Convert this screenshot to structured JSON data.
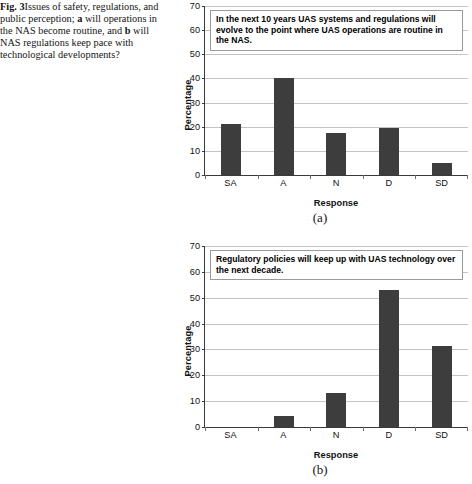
{
  "caption": {
    "figure_label": "Fig. 3",
    "text_part1": "Issues of safety, regulations, and public perception; ",
    "sub_a": "a",
    "text_part2": " will operations in the NAS become routine, and ",
    "sub_b": "b",
    "text_part3": " will NAS regulations keep pace with technological developments?"
  },
  "colors": {
    "bar": "#3d3d3d",
    "grid": "#c3c3c3",
    "axis": "#3a3a3a",
    "title_box_border": "#9a9a9a"
  },
  "panels": [
    {
      "letter": "(a)"
    },
    {
      "letter": "(b)"
    }
  ],
  "chart_data": [
    {
      "type": "bar",
      "panel": "(a)",
      "title": "In the next 10 years UAS systems and regulations will evolve to the point where UAS operations are routine in the NAS.",
      "categories": [
        "SA",
        "A",
        "N",
        "D",
        "SD"
      ],
      "values": [
        21,
        40,
        17.3,
        19.5,
        4.8
      ],
      "xlabel": "Response",
      "ylabel": "Percentage",
      "ylim": [
        0,
        70
      ],
      "yticks": [
        0,
        10,
        20,
        30,
        40,
        50,
        60,
        70
      ],
      "grid": true,
      "legend": "none"
    },
    {
      "type": "bar",
      "panel": "(b)",
      "title": "Regulatory policies will keep up with UAS technology over the next decade.",
      "categories": [
        "SA",
        "A",
        "N",
        "D",
        "SD"
      ],
      "values": [
        0,
        4.2,
        13.2,
        53,
        31.5
      ],
      "xlabel": "Response",
      "ylabel": "Percentage",
      "ylim": [
        0,
        70
      ],
      "yticks": [
        0,
        10,
        20,
        30,
        40,
        50,
        60,
        70
      ],
      "grid": true,
      "legend": "none"
    }
  ]
}
